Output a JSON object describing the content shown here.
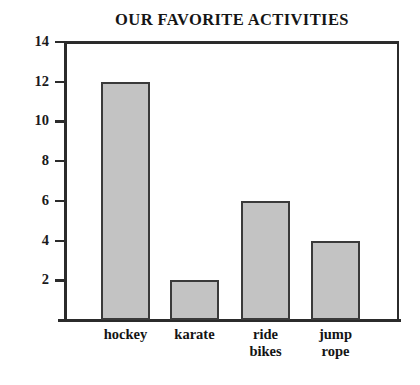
{
  "chart_data": {
    "type": "bar",
    "title": "OUR FAVORITE ACTIVITIES",
    "xlabel": "",
    "ylabel": "",
    "categories": [
      "hockey",
      "karate",
      "ride bikes",
      "jump rope"
    ],
    "category_lines": [
      [
        "hockey"
      ],
      [
        "karate"
      ],
      [
        "ride",
        "bikes"
      ],
      [
        "jump",
        "rope"
      ]
    ],
    "values": [
      12,
      2,
      6,
      4
    ],
    "ylim": [
      0,
      14
    ],
    "ytick_labels": [
      "14",
      "12",
      "10",
      "8",
      "6",
      "4",
      "2"
    ],
    "ytick_values": [
      14,
      12,
      10,
      8,
      6,
      4,
      2
    ],
    "ytick_step": 2,
    "grid": "horizontal",
    "legend": "none",
    "colors": {
      "bar_fill": "#c3c3c3",
      "bar_border": "#3a3a3a",
      "axis": "#2b2b2b",
      "grid": "#2e2e2e",
      "text": "#151515",
      "background": "#ffffff"
    }
  }
}
